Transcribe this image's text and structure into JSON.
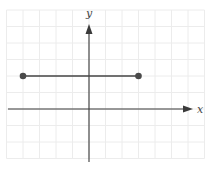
{
  "chart_data": {
    "type": "line",
    "title": "",
    "xlabel": "x",
    "ylabel": "y",
    "grid": true,
    "xlim": [
      -5,
      7
    ],
    "ylim": [
      -3,
      6
    ],
    "axes": {
      "x_label": "x",
      "y_label": "y",
      "arrows": [
        "positive-x",
        "positive-y"
      ]
    },
    "series": [
      {
        "name": "horizontal segment",
        "points": [
          {
            "x": -4,
            "y": 2
          },
          {
            "x": 3,
            "y": 2
          }
        ],
        "endpoints": "closed"
      }
    ],
    "tick_labels": []
  },
  "labels": {
    "x": "x",
    "y": "y"
  },
  "colors": {
    "grid": "#ececec",
    "axis": "#3a3a3a",
    "segment": "#444444"
  }
}
